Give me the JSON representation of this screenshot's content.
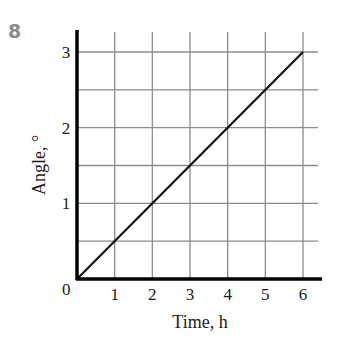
{
  "problem_number": "8",
  "chart_data": {
    "type": "line",
    "title": "",
    "xlabel": "Time, h",
    "ylabel": "Angle, °",
    "x_ticks": [
      "1",
      "2",
      "3",
      "4",
      "5",
      "6"
    ],
    "y_ticks": [
      "1",
      "2",
      "3"
    ],
    "origin_label": "0",
    "xlim": [
      0,
      6
    ],
    "ylim": [
      0,
      3
    ],
    "grid": true,
    "grid_x_step": 1,
    "grid_y_step": 0.5,
    "series": [
      {
        "name": "Angle vs time",
        "x": [
          0,
          6
        ],
        "y": [
          0,
          3
        ]
      }
    ],
    "line_color": "#111111",
    "grid_color": "#8c8c8c"
  }
}
